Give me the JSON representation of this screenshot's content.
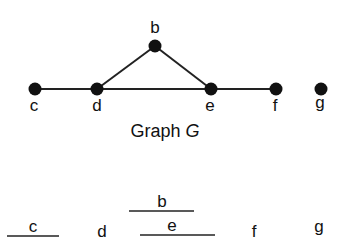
{
  "graph": {
    "caption_prefix": "Graph ",
    "caption_var": "G",
    "nodes": [
      {
        "id": "b",
        "label": "b"
      },
      {
        "id": "c",
        "label": "c"
      },
      {
        "id": "d",
        "label": "d"
      },
      {
        "id": "e",
        "label": "e"
      },
      {
        "id": "f",
        "label": "f"
      },
      {
        "id": "g",
        "label": "g"
      }
    ],
    "edges": [
      [
        "c",
        "d"
      ],
      [
        "d",
        "e"
      ],
      [
        "e",
        "f"
      ],
      [
        "d",
        "b"
      ],
      [
        "b",
        "e"
      ]
    ]
  },
  "intervals": {
    "labels": {
      "b": "b",
      "c": "c",
      "d": "d",
      "e": "e",
      "f": "f",
      "g": "g"
    }
  }
}
